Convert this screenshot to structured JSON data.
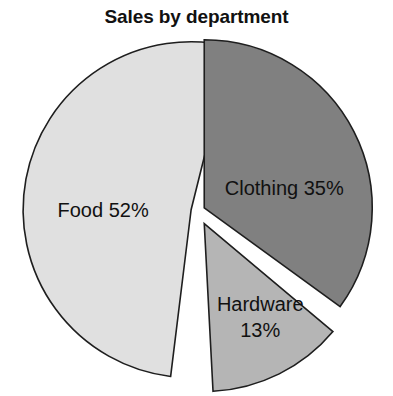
{
  "chart_data": {
    "type": "pie",
    "title": "Sales by department",
    "categories": [
      "Food",
      "Clothing",
      "Hardware"
    ],
    "values": [
      52,
      35,
      13
    ],
    "value_suffix": "%",
    "labels": [
      "Food 52%",
      "Clothing 35%",
      "Hardware 13%"
    ],
    "colors": [
      "#e0e0e0",
      "#808080",
      "#b5b5b5"
    ],
    "exploded": true,
    "legend": "none",
    "grid": false,
    "xlabel": "",
    "ylabel": ""
  },
  "slices": [
    {
      "name": "Food",
      "value": 52,
      "label_line1": "Food 52%",
      "label_line2": "",
      "color": "#e0e0e0",
      "start_deg": 187,
      "end_deg": 374,
      "explode": 7,
      "label_dx": -88,
      "label_dy": 2
    },
    {
      "name": "Clothing",
      "value": 35,
      "label_line1": "Clothing 35%",
      "label_line2": "",
      "color": "#808080",
      "start_deg": 0,
      "end_deg": 126,
      "explode": 7,
      "label_dx": 80,
      "label_dy": -18
    },
    {
      "name": "Hardware",
      "value": 13,
      "label_line1": "Hardware",
      "label_line2": "13%",
      "color": "#b5b5b5",
      "start_deg": 130,
      "end_deg": 177,
      "explode": 14,
      "label_dx": 56,
      "label_dy": 82
    }
  ]
}
